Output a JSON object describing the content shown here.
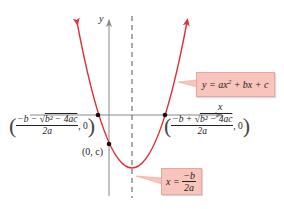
{
  "diagram": {
    "type": "parabola-graph",
    "colors": {
      "curve": "#e0303a",
      "axis": "#888888",
      "dashed": "#555555",
      "point": "#111111",
      "label_bg": "#f8c4bb",
      "label_border": "#e9a79c"
    },
    "axes": {
      "x_label": "x",
      "y_label": "y"
    },
    "curve_label": {
      "lhs": "y = ax",
      "exp": "2",
      "rhs": " + bx + c"
    },
    "vertex_label": {
      "lhs": "x = ",
      "numerator": "−b",
      "denominator": "2a"
    },
    "left_root": {
      "numerator": "−b − √b² − 4ac",
      "numerator_prefix": "−b − ",
      "radicand": "b² − 4ac",
      "denominator": "2a",
      "y": "0"
    },
    "right_root": {
      "numerator_prefix": "−b + ",
      "radicand": "b² − 4ac",
      "denominator": "2a",
      "y": "0"
    },
    "y_intercept": {
      "label": "(0, c)"
    }
  }
}
